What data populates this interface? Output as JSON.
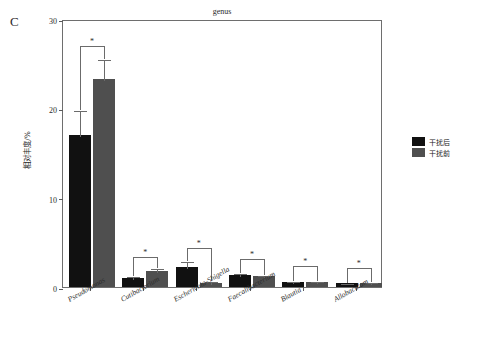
{
  "panel": {
    "label": "C"
  },
  "legend": {
    "position": "right",
    "items": [
      {
        "label": "干扰后",
        "color": "#111111",
        "name": "after-intervention"
      },
      {
        "label": "干扰前",
        "color": "#4f4f4f",
        "name": "before-intervention"
      }
    ]
  },
  "axis": {
    "y_title": "相对丰度/%",
    "y_ticks": [
      "0",
      "10",
      "20",
      "30"
    ]
  },
  "chart_data": {
    "type": "bar",
    "title": "genus",
    "xlabel": "",
    "ylabel": "相对丰度/%",
    "ylim": [
      0,
      30
    ],
    "yticks": [
      0,
      10,
      20,
      30
    ],
    "grid": false,
    "legend_position": "right",
    "categories": [
      "Pseudomonas",
      "Cutibacterium",
      "Escherichia-Shigella",
      "Faecalibacterium",
      "Blautia",
      "Allobaculum"
    ],
    "series": [
      {
        "name": "干扰后",
        "color": "#111111",
        "values": [
          17.0,
          1.0,
          2.2,
          1.3,
          0.6,
          0.45
        ],
        "errors": [
          2.9,
          0.35,
          0.8,
          0.35,
          0.2,
          0.15
        ]
      },
      {
        "name": "干扰前",
        "color": "#4f4f4f",
        "values": [
          23.3,
          1.8,
          0.5,
          1.2,
          0.6,
          0.5
        ],
        "errors": [
          2.3,
          0.45,
          0.25,
          0.3,
          0.2,
          0.2
        ]
      }
    ],
    "annotations": [
      {
        "category": "Pseudomonas",
        "marker": "*",
        "top": 27.2
      },
      {
        "category": "Cutibacterium",
        "marker": "*",
        "top": 3.6
      },
      {
        "category": "Escherichia-Shigella",
        "marker": "*",
        "top": 4.6
      },
      {
        "category": "Faecalibacterium",
        "marker": "*",
        "top": 3.4
      },
      {
        "category": "Blautia",
        "marker": "*",
        "top": 2.6
      },
      {
        "category": "Allobaculum",
        "marker": "*",
        "top": 2.3
      }
    ]
  }
}
